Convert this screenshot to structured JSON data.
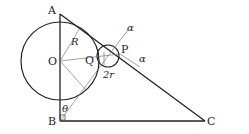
{
  "diagram": {
    "points": {
      "A": "A",
      "B": "B",
      "C": "C",
      "O": "O",
      "P": "P",
      "Q": "Q"
    },
    "labels": {
      "R": "R",
      "two_r": "2r",
      "alpha1": "α",
      "alpha2": "α",
      "theta": "θ"
    },
    "colors": {
      "stroke": "#222222",
      "thin": "#666666"
    }
  }
}
